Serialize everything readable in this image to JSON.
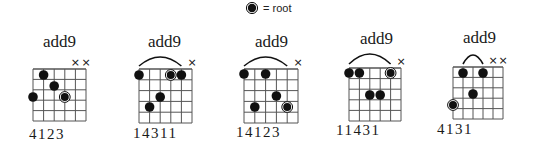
{
  "legend": {
    "symbol": "root-marker",
    "label": "= root"
  },
  "colors": {
    "ink": "#111111",
    "grid": "#555555",
    "background": "#ffffff"
  },
  "chords": [
    {
      "name": "add9",
      "fingering": "4123",
      "title_pos": [
        43,
        32
      ],
      "fingers_pos": [
        29,
        126
      ],
      "grid": {
        "x": 33,
        "y": 69,
        "string_gap": 10.6,
        "fret_gap": 10.4,
        "strings": 6,
        "frets": 5
      },
      "muted": [
        5,
        6
      ],
      "barre": null,
      "dots": [
        {
          "string": 2,
          "y": 75,
          "root": false
        },
        {
          "string": 3,
          "y": 86,
          "root": false
        },
        {
          "string": 1,
          "y": 97,
          "root": false
        },
        {
          "string": 4,
          "y": 97,
          "root": true
        }
      ]
    },
    {
      "name": "add9",
      "fingering": "14311",
      "title_pos": [
        148,
        32
      ],
      "fingers_pos": [
        133,
        125
      ],
      "grid": {
        "x": 139,
        "y": 69,
        "string_gap": 10.6,
        "fret_gap": 10.8,
        "strings": 6,
        "frets": 5
      },
      "muted": [
        6
      ],
      "barre": {
        "from": 1,
        "to": 5,
        "peak": 57,
        "base": 66
      },
      "dots": [
        {
          "string": 1,
          "y": 75,
          "root": false
        },
        {
          "string": 4,
          "y": 75,
          "root": true
        },
        {
          "string": 5,
          "y": 75,
          "root": false
        },
        {
          "string": 3,
          "y": 97,
          "root": false
        },
        {
          "string": 2,
          "y": 107,
          "root": false
        }
      ]
    },
    {
      "name": "add9",
      "fingering": "14123",
      "title_pos": [
        255,
        32
      ],
      "fingers_pos": [
        236,
        124
      ],
      "grid": {
        "x": 244,
        "y": 69,
        "string_gap": 10.8,
        "fret_gap": 10.8,
        "strings": 6,
        "frets": 5
      },
      "muted": [
        6
      ],
      "barre": {
        "from": 1,
        "to": 5,
        "peak": 57,
        "base": 66
      },
      "dots": [
        {
          "string": 1,
          "y": 74,
          "root": false
        },
        {
          "string": 3,
          "y": 74,
          "root": false
        },
        {
          "string": 4,
          "y": 96,
          "root": false
        },
        {
          "string": 2,
          "y": 107,
          "root": false
        },
        {
          "string": 5,
          "y": 107,
          "root": true
        }
      ]
    },
    {
      "name": "add9",
      "fingering": "11431",
      "title_pos": [
        360,
        29
      ],
      "fingers_pos": [
        336,
        122
      ],
      "grid": {
        "x": 349,
        "y": 68,
        "string_gap": 10.4,
        "fret_gap": 10.6,
        "strings": 6,
        "frets": 5
      },
      "muted": [
        6
      ],
      "barre": {
        "from": 1,
        "to": 5,
        "peak": 54,
        "base": 64
      },
      "dots": [
        {
          "string": 1,
          "y": 73,
          "root": false
        },
        {
          "string": 2,
          "y": 73,
          "root": false
        },
        {
          "string": 5,
          "y": 73,
          "root": true
        },
        {
          "string": 3,
          "y": 95,
          "root": false
        },
        {
          "string": 4,
          "y": 95,
          "root": false
        }
      ]
    },
    {
      "name": "add9",
      "fingering": "4131",
      "title_pos": [
        463,
        28
      ],
      "fingers_pos": [
        437,
        121
      ],
      "grid": {
        "x": 453,
        "y": 67,
        "string_gap": 10.0,
        "fret_gap": 10.4,
        "strings": 6,
        "frets": 5
      },
      "muted": [
        5,
        6
      ],
      "barre": {
        "from": 2,
        "to": 4,
        "peak": 55,
        "base": 64
      },
      "dots": [
        {
          "string": 2,
          "y": 73,
          "root": false
        },
        {
          "string": 4,
          "y": 73,
          "root": false
        },
        {
          "string": 3,
          "y": 94,
          "root": false
        },
        {
          "string": 1,
          "y": 105,
          "root": true
        }
      ]
    }
  ]
}
